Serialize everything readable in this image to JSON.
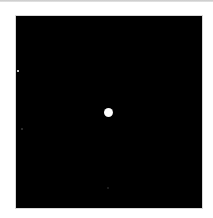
{
  "image": {
    "background_color": "#ffffff",
    "panel_color": "#000000",
    "points": [
      {
        "name": "bright-central-point",
        "x": 92,
        "y": 96,
        "radius": 4.5,
        "color": "#ffffff"
      },
      {
        "name": "faint-point-left-upper",
        "x": 2,
        "y": 55,
        "color": "#bdbdbd"
      },
      {
        "name": "faint-point-left-lower",
        "x": 6,
        "y": 113,
        "color": "#3a3a3a"
      },
      {
        "name": "faint-point-bottom",
        "x": 92,
        "y": 172,
        "color": "#262626"
      }
    ]
  },
  "caption": {
    "text": ""
  }
}
